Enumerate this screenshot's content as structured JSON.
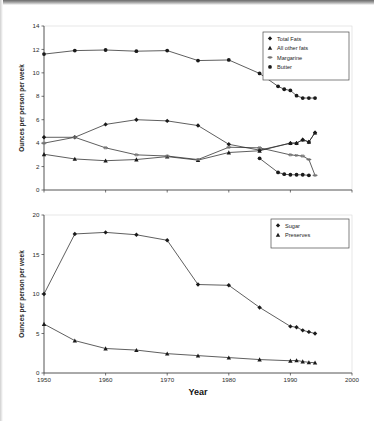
{
  "figure": {
    "background": "#ffffff",
    "ink_color": "#2a2a2a"
  },
  "chart_data": [
    {
      "id": "fats",
      "type": "line",
      "title": "",
      "xlabel": "",
      "ylabel": "Ounces per person per week",
      "xlim": [
        1950,
        2000
      ],
      "ylim": [
        0,
        14
      ],
      "yticks": [
        0,
        2,
        4,
        6,
        8,
        10,
        12,
        14
      ],
      "yticklabels": [
        "0",
        "2",
        "4",
        "6",
        "8",
        "10",
        "12",
        "14"
      ],
      "xticks": [
        1950,
        1960,
        1970,
        1980,
        1990,
        2000
      ],
      "xticklabels": [
        "",
        "",
        "",
        "",
        "",
        ""
      ],
      "grid": false,
      "legend_position": "upper right",
      "series": [
        {
          "name": "Total Fats",
          "marker": "diamond",
          "x": [
            1950,
            1955,
            1960,
            1965,
            1970,
            1975,
            1980,
            1985,
            1990,
            1991,
            1992,
            1993,
            1994
          ],
          "values": [
            4.5,
            4.5,
            5.6,
            6.0,
            5.9,
            5.5,
            3.9,
            3.4,
            4.0,
            4.0,
            4.3,
            4.1,
            4.9
          ]
        },
        {
          "name": "All other fats",
          "marker": "triangle",
          "x": [
            1950,
            1955,
            1960,
            1965,
            1970,
            1975,
            1980,
            1985,
            1990,
            1991,
            1992,
            1993,
            1994
          ],
          "values": [
            3.05,
            2.65,
            2.5,
            2.6,
            2.85,
            2.55,
            3.2,
            3.35,
            4.0,
            4.0,
            4.3,
            4.1,
            4.9
          ]
        },
        {
          "name": "Margarine",
          "marker": "dash",
          "x": [
            1950,
            1955,
            1960,
            1965,
            1970,
            1975,
            1980,
            1985,
            1990,
            1991,
            1992,
            1993,
            1994
          ],
          "values": [
            4.0,
            4.5,
            3.6,
            3.0,
            2.9,
            2.6,
            3.65,
            3.6,
            3.0,
            2.95,
            2.9,
            2.6,
            1.25
          ]
        },
        {
          "name": "Butter",
          "marker": "circle",
          "x": [
            1950,
            1955,
            1960,
            1965,
            1970,
            1975,
            1980,
            1985,
            1988,
            1989,
            1990,
            1991,
            1992,
            1993,
            1994
          ],
          "values": [
            11.6,
            11.9,
            11.95,
            11.85,
            11.9,
            11.05,
            11.1,
            9.95,
            8.85,
            8.6,
            8.5,
            8.05,
            7.85,
            7.85,
            7.85
          ]
        },
        {
          "name": "Butter-low-tail",
          "marker": "circle",
          "x": [
            1985,
            1988,
            1989,
            1990,
            1991,
            1992,
            1993
          ],
          "values": [
            2.7,
            1.5,
            1.35,
            1.3,
            1.3,
            1.3,
            1.25
          ]
        }
      ]
    },
    {
      "id": "sugar",
      "type": "line",
      "title": "",
      "xlabel": "Year",
      "ylabel": "Ounces per person per week",
      "xlim": [
        1950,
        2000
      ],
      "ylim": [
        0,
        20
      ],
      "yticks": [
        0,
        5,
        10,
        15,
        20
      ],
      "yticklabels": [
        "0",
        "5",
        "10",
        "15",
        "20"
      ],
      "xticks": [
        1950,
        1960,
        1970,
        1980,
        1990,
        2000
      ],
      "xticklabels": [
        "1950",
        "1960",
        "1970",
        "1980",
        "1990",
        "2000"
      ],
      "grid": false,
      "legend_position": "upper right",
      "series": [
        {
          "name": "Sugar",
          "marker": "diamond",
          "x": [
            1950,
            1955,
            1960,
            1965,
            1970,
            1975,
            1980,
            1985,
            1990,
            1991,
            1992,
            1993,
            1994
          ],
          "values": [
            10.0,
            17.6,
            17.8,
            17.5,
            16.8,
            11.2,
            11.1,
            8.3,
            5.9,
            5.8,
            5.4,
            5.2,
            5.0
          ]
        },
        {
          "name": "Preserves",
          "marker": "triangle",
          "x": [
            1950,
            1955,
            1960,
            1965,
            1970,
            1975,
            1980,
            1985,
            1990,
            1991,
            1992,
            1993,
            1994
          ],
          "values": [
            6.2,
            4.1,
            3.1,
            2.9,
            2.45,
            2.2,
            1.95,
            1.7,
            1.55,
            1.6,
            1.45,
            1.35,
            1.3
          ]
        }
      ]
    }
  ]
}
